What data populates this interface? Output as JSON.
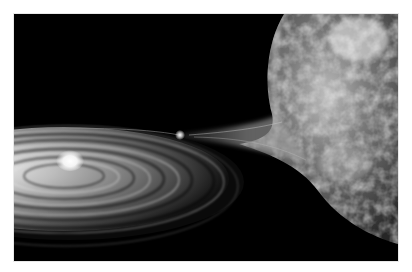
{
  "image": {
    "description": "Artist rendering of a binary star system: a large textured giant star on the right loses gas in a tidal stream that spirals into an accretion disk around a bright compact star on the left",
    "palette": {
      "background": "#ffffff",
      "space": "#000000",
      "disk_bright": "#e6e6e6",
      "disk_mid": "#8a8a8a",
      "star_surface": "#7a7a7a",
      "star_highlight": "#f2f2f2",
      "core_glow": "#ffffff"
    },
    "elements": [
      "giant-star",
      "tidal-gas-stream",
      "accretion-disk",
      "compact-star-core",
      "hot-spot"
    ]
  }
}
